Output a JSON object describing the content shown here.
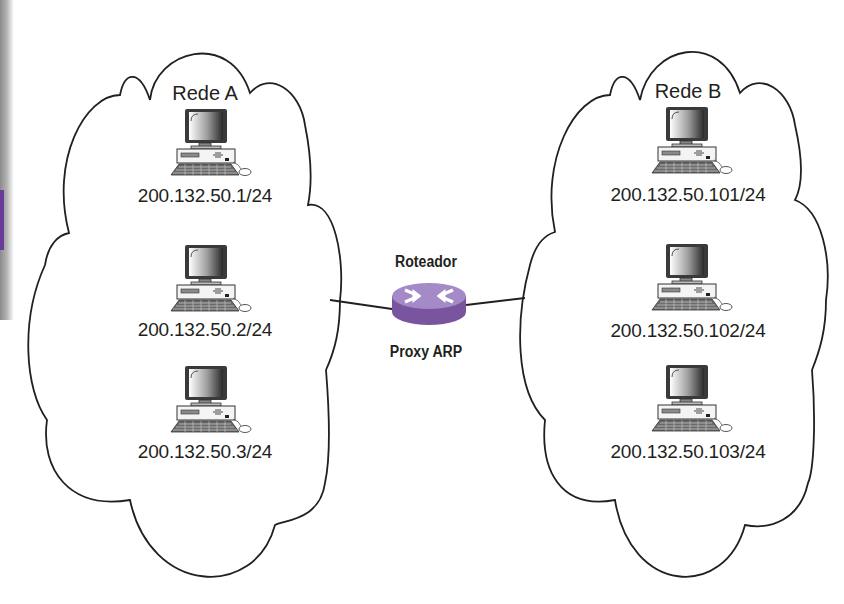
{
  "networks": [
    {
      "name": "Rede A",
      "hosts": [
        {
          "ip": "200.132.50.1/24",
          "icon": "desktop-computer-icon"
        },
        {
          "ip": "200.132.50.2/24",
          "icon": "desktop-computer-icon"
        },
        {
          "ip": "200.132.50.3/24",
          "icon": "desktop-computer-icon"
        }
      ]
    },
    {
      "name": "Rede B",
      "hosts": [
        {
          "ip": "200.132.50.101/24",
          "icon": "desktop-computer-icon"
        },
        {
          "ip": "200.132.50.102/24",
          "icon": "desktop-computer-icon"
        },
        {
          "ip": "200.132.50.103/24",
          "icon": "desktop-computer-icon"
        }
      ]
    }
  ],
  "router": {
    "title": "Roteador",
    "subtitle": "Proxy ARP",
    "icon": "router-icon",
    "color": "#8e6bb5"
  },
  "colors": {
    "line": "#231f20",
    "text": "#231f20",
    "router_top": "#a48ac6",
    "router_side": "#7a559f"
  }
}
